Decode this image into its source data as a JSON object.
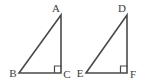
{
  "figure": {
    "width": 149,
    "height": 84,
    "background_color": "#ffffff",
    "stroke_color": "#4a4a4a",
    "label_color": "#3b3b3b",
    "stroke_width": 1.6,
    "label_font_size": 11
  },
  "triangles": [
    {
      "name": "triangle-abc",
      "vertices": [
        {
          "label": "A",
          "x": 61,
          "y": 15,
          "label_x": 56,
          "label_y": 12,
          "anchor": "middle"
        },
        {
          "label": "B",
          "x": 19,
          "y": 73,
          "label_x": 13,
          "label_y": 77,
          "anchor": "middle"
        },
        {
          "label": "C",
          "x": 61,
          "y": 73,
          "label_x": 67,
          "label_y": 78,
          "anchor": "middle"
        }
      ],
      "right_angle_vertex": "C",
      "right_angle_mark": {
        "x": 54.5,
        "y": 66,
        "size": 7
      },
      "path": "M 61 15 L 19 73 L 61 73 Z"
    },
    {
      "name": "triangle-def",
      "vertices": [
        {
          "label": "D",
          "x": 127,
          "y": 15,
          "label_x": 122,
          "label_y": 12,
          "anchor": "middle"
        },
        {
          "label": "E",
          "x": 86,
          "y": 73,
          "label_x": 80,
          "label_y": 77,
          "anchor": "middle"
        },
        {
          "label": "F",
          "x": 127,
          "y": 73,
          "label_x": 133,
          "label_y": 78,
          "anchor": "middle"
        }
      ],
      "right_angle_vertex": "F",
      "right_angle_mark": {
        "x": 120.5,
        "y": 66,
        "size": 7
      },
      "path": "M 127 15 L 86 73 L 127 73 Z"
    }
  ]
}
